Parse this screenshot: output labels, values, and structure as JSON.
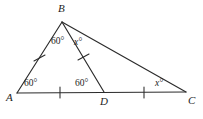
{
  "figure": {
    "kind": "euclidean-geometry-diagram",
    "background_color": "#ffffff",
    "stroke_color": "#2b2b2b",
    "text_color": "#1d1d1d",
    "vertices": {
      "A": {
        "label": "A",
        "x": 17,
        "y": 93
      },
      "B": {
        "label": "B",
        "x": 62,
        "y": 22
      },
      "C": {
        "label": "C",
        "x": 186,
        "y": 92
      },
      "D": {
        "label": "D",
        "x": 104,
        "y": 92
      }
    },
    "vertex_label_positions": {
      "A": {
        "x": 6,
        "y": 101
      },
      "B": {
        "x": 58,
        "y": 12
      },
      "C": {
        "x": 189,
        "y": 103
      },
      "D": {
        "x": 100,
        "y": 104
      }
    },
    "segments": [
      {
        "name": "AB",
        "from": "A",
        "to": "B",
        "tick_count": 1
      },
      {
        "name": "BC",
        "from": "B",
        "to": "C",
        "tick_count": 0
      },
      {
        "name": "AD",
        "from": "A",
        "to": "D",
        "tick_count": 1
      },
      {
        "name": "DC",
        "from": "D",
        "to": "C",
        "tick_count": 1
      },
      {
        "name": "BD",
        "from": "B",
        "to": "D",
        "tick_count": 1
      }
    ],
    "angle_labels": [
      {
        "name": "angle-A",
        "at_vertex": "A",
        "text": "60°",
        "italic": false,
        "x": 24,
        "y": 86
      },
      {
        "name": "angle-ABD",
        "at_vertex": "B",
        "text": "60°",
        "italic": false,
        "x": 54,
        "y": 43
      },
      {
        "name": "angle-DBC",
        "at_vertex": "B",
        "text": "x°",
        "italic": true,
        "x": 76,
        "y": 44
      },
      {
        "name": "angle-BDA",
        "at_vertex": "D",
        "text": "60°",
        "italic": false,
        "x": 77,
        "y": 86
      },
      {
        "name": "angle-C",
        "at_vertex": "C",
        "text": "x°",
        "italic": true,
        "x": 156,
        "y": 85
      }
    ],
    "tick_marks": [
      {
        "name": "tick-AB",
        "on_segment": "AB",
        "x": 39,
        "y": 58
      },
      {
        "name": "tick-AD",
        "on_segment": "AD",
        "x": 60,
        "y": 92
      },
      {
        "name": "tick-DC",
        "on_segment": "DC",
        "x": 144,
        "y": 92
      },
      {
        "name": "tick-BD",
        "on_segment": "BD",
        "x": 83,
        "y": 57
      }
    ]
  }
}
